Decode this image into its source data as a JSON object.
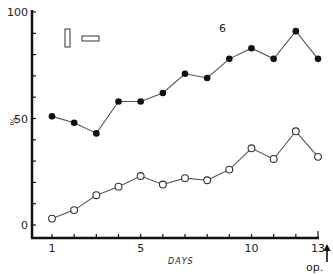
{
  "chart_data": {
    "type": "line",
    "title": "",
    "annotation": "6",
    "xlabel": "DAYS",
    "ylabel": "%",
    "xlim": [
      1,
      13
    ],
    "ylim": [
      0,
      100
    ],
    "x_tick_labels": [
      "1",
      "5",
      "10",
      "13"
    ],
    "y_tick_labels": [
      "0",
      "50",
      "100"
    ],
    "x_end_marker": "op.",
    "grid": false,
    "legend": [
      "vertical-bar-symbol",
      "horizontal-bar-symbol"
    ],
    "x": [
      1,
      2,
      3,
      4,
      5,
      6,
      7,
      8,
      9,
      10,
      11,
      12,
      13
    ],
    "series": [
      {
        "name": "filled-circles",
        "marker": "filled",
        "values": [
          51,
          48,
          43,
          58,
          58,
          62,
          71,
          69,
          78,
          83,
          78,
          91,
          78
        ]
      },
      {
        "name": "open-circles",
        "marker": "open",
        "values": [
          3,
          7,
          14,
          18,
          23,
          19,
          22,
          21,
          26,
          36,
          31,
          44,
          32
        ]
      }
    ]
  },
  "colors": {
    "axis": "#111111",
    "line": "#555555",
    "marker_fill": "#111111",
    "open_marker_fill": "#ffffff"
  }
}
